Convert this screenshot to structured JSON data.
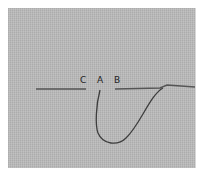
{
  "diagram": {
    "labels": [
      {
        "id": "C",
        "text": "C"
      },
      {
        "id": "A",
        "text": "A"
      },
      {
        "id": "B",
        "text": "B"
      }
    ],
    "colors": {
      "fabric": "#b9b9b9",
      "thread": "#4a4a4a",
      "background": "#ffffff"
    }
  }
}
